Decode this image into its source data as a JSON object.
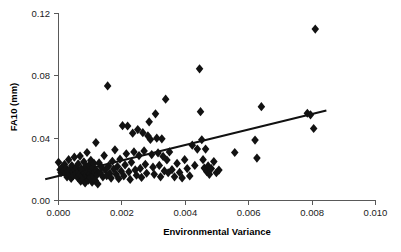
{
  "chart_data": {
    "type": "scatter",
    "title": "",
    "xlabel": "Environmental Variance",
    "ylabel": "FA10 (mm)",
    "xlim": [
      0.0,
      0.01
    ],
    "ylim": [
      0.0,
      0.12
    ],
    "xticks": [
      0.0,
      0.002,
      0.004,
      0.006,
      0.008,
      0.01
    ],
    "xtick_labels": [
      "0.000",
      "0.002",
      "0.004",
      "0.006",
      "0.008",
      "0.010"
    ],
    "yticks": [
      0.0,
      0.04,
      0.08,
      0.12
    ],
    "ytick_labels": [
      "0.00",
      "0.04",
      "0.08",
      "0.12"
    ],
    "grid": false,
    "legend": null,
    "marker": "diamond",
    "marker_color": "#121212",
    "marker_size": 4.6,
    "trend_line": {
      "type": "linear-regression",
      "color": "#111111",
      "x_start": -0.00042,
      "y_start": 0.0137,
      "x_end": 0.00845,
      "y_end": 0.0578
    },
    "points": [
      [
        0.0,
        0.0245
      ],
      [
        5e-05,
        0.0198
      ],
      [
        8e-05,
        0.0179
      ],
      [
        0.00012,
        0.0215
      ],
      [
        0.00016,
        0.0188
      ],
      [
        0.00019,
        0.0232
      ],
      [
        0.00022,
        0.0173
      ],
      [
        0.00025,
        0.0205
      ],
      [
        0.00027,
        0.0151
      ],
      [
        0.0003,
        0.019
      ],
      [
        0.00032,
        0.0262
      ],
      [
        0.00035,
        0.0168
      ],
      [
        0.00037,
        0.0201
      ],
      [
        0.0004,
        0.0142
      ],
      [
        0.00042,
        0.0224
      ],
      [
        0.00045,
        0.0186
      ],
      [
        0.00047,
        0.016
      ],
      [
        0.0005,
        0.0278
      ],
      [
        0.00052,
        0.0196
      ],
      [
        0.00055,
        0.0172
      ],
      [
        0.00057,
        0.0211
      ],
      [
        0.0006,
        0.0148
      ],
      [
        0.00062,
        0.0235
      ],
      [
        0.00064,
        0.0183
      ],
      [
        0.00066,
        0.0165
      ],
      [
        0.00068,
        0.0285
      ],
      [
        0.0007,
        0.0124
      ],
      [
        0.00072,
        0.0204
      ],
      [
        0.00074,
        0.0157
      ],
      [
        0.00076,
        0.0192
      ],
      [
        0.00078,
        0.0136
      ],
      [
        0.0008,
        0.0248
      ],
      [
        0.00082,
        0.0176
      ],
      [
        0.00084,
        0.0113
      ],
      [
        0.00086,
        0.0219
      ],
      [
        0.00088,
        0.0163
      ],
      [
        0.0009,
        0.0308
      ],
      [
        0.00092,
        0.0185
      ],
      [
        0.00094,
        0.0131
      ],
      [
        0.00096,
        0.0226
      ],
      [
        0.00098,
        0.017
      ],
      [
        0.001,
        0.0147
      ],
      [
        0.00102,
        0.0258
      ],
      [
        0.00104,
        0.0198
      ],
      [
        0.00106,
        0.0118
      ],
      [
        0.00108,
        0.0209
      ],
      [
        0.0011,
        0.0155
      ],
      [
        0.00112,
        0.0238
      ],
      [
        0.00114,
        0.0181
      ],
      [
        0.00116,
        0.0128
      ],
      [
        0.00118,
        0.0372
      ],
      [
        0.0012,
        0.0193
      ],
      [
        0.00122,
        0.0166
      ],
      [
        0.00124,
        0.0106
      ],
      [
        0.00128,
        0.0241
      ],
      [
        0.00132,
        0.0178
      ],
      [
        0.00136,
        0.0213
      ],
      [
        0.0014,
        0.0152
      ],
      [
        0.00144,
        0.0288
      ],
      [
        0.00148,
        0.0195
      ],
      [
        0.00152,
        0.0159
      ],
      [
        0.00155,
        0.0735
      ],
      [
        0.00158,
        0.0222
      ],
      [
        0.00162,
        0.0174
      ],
      [
        0.00166,
        0.0144
      ],
      [
        0.0017,
        0.0252
      ],
      [
        0.00174,
        0.0202
      ],
      [
        0.00178,
        0.0325
      ],
      [
        0.00182,
        0.0168
      ],
      [
        0.00186,
        0.0218
      ],
      [
        0.0019,
        0.014
      ],
      [
        0.00194,
        0.0265
      ],
      [
        0.00198,
        0.0188
      ],
      [
        0.00202,
        0.048
      ],
      [
        0.00206,
        0.0158
      ],
      [
        0.0021,
        0.0228
      ],
      [
        0.00214,
        0.03
      ],
      [
        0.00218,
        0.0478
      ],
      [
        0.00222,
        0.0184
      ],
      [
        0.00226,
        0.0135
      ],
      [
        0.0023,
        0.0245
      ],
      [
        0.00234,
        0.0432
      ],
      [
        0.00238,
        0.0312
      ],
      [
        0.00242,
        0.0196
      ],
      [
        0.00246,
        0.0162
      ],
      [
        0.0025,
        0.0455
      ],
      [
        0.00254,
        0.0288
      ],
      [
        0.00258,
        0.0206
      ],
      [
        0.00262,
        0.0148
      ],
      [
        0.00266,
        0.0435
      ],
      [
        0.0027,
        0.0318
      ],
      [
        0.00274,
        0.0232
      ],
      [
        0.00278,
        0.0175
      ],
      [
        0.00282,
        0.0415
      ],
      [
        0.00286,
        0.0505
      ],
      [
        0.0029,
        0.0392
      ],
      [
        0.00294,
        0.0295
      ],
      [
        0.00298,
        0.0214
      ],
      [
        0.00302,
        0.0168
      ],
      [
        0.00306,
        0.0556
      ],
      [
        0.0031,
        0.04
      ],
      [
        0.00314,
        0.0305
      ],
      [
        0.00318,
        0.0225
      ],
      [
        0.00322,
        0.0152
      ],
      [
        0.00326,
        0.0396
      ],
      [
        0.0033,
        0.0283
      ],
      [
        0.00334,
        0.019
      ],
      [
        0.00338,
        0.065
      ],
      [
        0.00342,
        0.026
      ],
      [
        0.00346,
        0.0178
      ],
      [
        0.0035,
        0.0312
      ],
      [
        0.00358,
        0.0198
      ],
      [
        0.00366,
        0.0152
      ],
      [
        0.00374,
        0.0238
      ],
      [
        0.00382,
        0.018
      ],
      [
        0.0039,
        0.0145
      ],
      [
        0.00398,
        0.0262
      ],
      [
        0.00406,
        0.0205
      ],
      [
        0.00414,
        0.0158
      ],
      [
        0.00422,
        0.0355
      ],
      [
        0.0043,
        0.0225
      ],
      [
        0.00438,
        0.033
      ],
      [
        0.00445,
        0.0845
      ],
      [
        0.00448,
        0.057
      ],
      [
        0.00452,
        0.039
      ],
      [
        0.00456,
        0.0262
      ],
      [
        0.0046,
        0.0208
      ],
      [
        0.00464,
        0.033
      ],
      [
        0.00468,
        0.0185
      ],
      [
        0.00472,
        0.0222
      ],
      [
        0.00476,
        0.0168
      ],
      [
        0.00482,
        0.0205
      ],
      [
        0.0049,
        0.025
      ],
      [
        0.00498,
        0.0178
      ],
      [
        0.00506,
        0.0195
      ],
      [
        0.00556,
        0.0308
      ],
      [
        0.0062,
        0.0388
      ],
      [
        0.00626,
        0.0272
      ],
      [
        0.0064,
        0.0602
      ],
      [
        0.00785,
        0.056
      ],
      [
        0.00795,
        0.055
      ],
      [
        0.00805,
        0.0462
      ],
      [
        0.0081,
        0.11
      ]
    ]
  }
}
